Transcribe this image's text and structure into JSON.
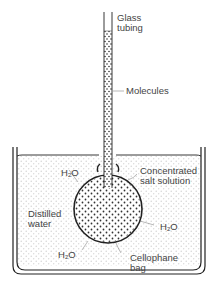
{
  "diagram": {
    "labels": {
      "glass_tubing_1": "Glass",
      "glass_tubing_2": "tubing",
      "molecules": "Molecules",
      "concentrated_1": "Concentrated",
      "concentrated_2": "salt solution",
      "distilled_1": "Distilled",
      "distilled_2": "water",
      "cellophane_1": "Cellophane",
      "cellophane_2": "bag",
      "water_h": "H",
      "water_sub": "2",
      "water_o": "O"
    },
    "colors": {
      "line": "#222222",
      "water_dots": "#cfcfcf",
      "solution_dots": "#333333",
      "label_text": "#444444",
      "leader_line": "#888888"
    }
  }
}
